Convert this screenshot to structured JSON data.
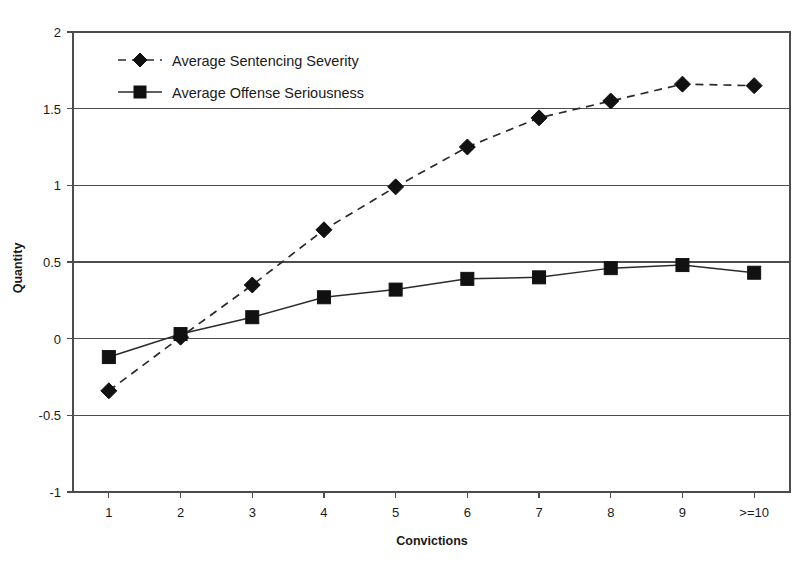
{
  "chart_data": {
    "type": "line",
    "title": "",
    "xlabel": "Convictions",
    "ylabel": "Quantity",
    "categories": [
      "1",
      "2",
      "3",
      "4",
      "5",
      "6",
      "7",
      "8",
      "9",
      ">=10"
    ],
    "xtick_labels": [
      "1",
      "2",
      "3",
      "4",
      "5",
      "6",
      "7",
      "8",
      "9",
      ">=10"
    ],
    "ytick_labels": [
      "2",
      "1.5",
      "1",
      "0.5",
      "0",
      "-0.5",
      "-1"
    ],
    "ytick_values": [
      2,
      1.5,
      1,
      0.5,
      0,
      -0.5,
      -1
    ],
    "ylim": [
      -1,
      2
    ],
    "grid": true,
    "grid_axis": "y",
    "legend_position": "top-left-inside",
    "series": [
      {
        "name": "Average Sentencing Severity",
        "marker": "diamond",
        "linestyle": "dashed",
        "color": "#111111",
        "values": [
          -0.34,
          0.01,
          0.35,
          0.71,
          0.99,
          1.25,
          1.44,
          1.55,
          1.66,
          1.65
        ]
      },
      {
        "name": "Average Offense Seriousness",
        "marker": "square",
        "linestyle": "solid",
        "color": "#111111",
        "values": [
          -0.12,
          0.03,
          0.14,
          0.27,
          0.32,
          0.39,
          0.4,
          0.46,
          0.48,
          0.43
        ]
      }
    ]
  },
  "legend": {
    "entries": [
      {
        "label": "Average Sentencing Severity"
      },
      {
        "label": "Average Offense Seriousness"
      }
    ]
  },
  "axes": {
    "y_title": "Quantity",
    "x_title": "Convictions"
  }
}
